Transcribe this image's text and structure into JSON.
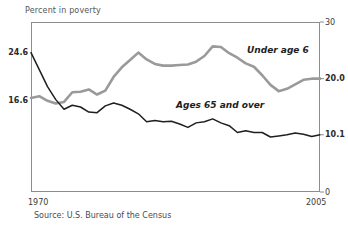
{
  "chart_data": {
    "type": "line",
    "title": "Percent in poverty",
    "xlabel": "",
    "ylabel": "Percent in poverty",
    "source": "Source:  U.S. Bureau of the Census",
    "grid": false,
    "legend_position": "inline-annotation",
    "xlim": [
      1970,
      2005
    ],
    "ylim": [
      0,
      30
    ],
    "x_tick_labels": [
      "1970",
      "2005"
    ],
    "y_tick_labels_right": [
      "30",
      "20.0",
      "10.1",
      "0"
    ],
    "y_tick_values_right": [
      30,
      20.0,
      10.1,
      0
    ],
    "y_tick_labels_left": [
      "24.6",
      "16.6"
    ],
    "y_tick_values_left": [
      24.6,
      16.6
    ],
    "x": [
      1970,
      1971,
      1972,
      1973,
      1974,
      1975,
      1976,
      1977,
      1978,
      1979,
      1980,
      1981,
      1982,
      1983,
      1984,
      1985,
      1986,
      1987,
      1988,
      1989,
      1990,
      1991,
      1992,
      1993,
      1994,
      1995,
      1996,
      1997,
      1998,
      1999,
      2000,
      2001,
      2002,
      2003,
      2004,
      2005
    ],
    "series": [
      {
        "name": "Under age 6",
        "color": "#9a9a9a",
        "annotation": "Under age 6",
        "start_value": 16.6,
        "end_value": 20.0,
        "values": [
          16.6,
          16.9,
          16.1,
          15.6,
          15.9,
          17.6,
          17.7,
          18.1,
          17.2,
          17.9,
          20.3,
          22.0,
          23.3,
          24.6,
          23.4,
          22.6,
          22.3,
          22.3,
          22.4,
          22.5,
          23.0,
          24.0,
          25.7,
          25.6,
          24.5,
          23.7,
          22.7,
          22.1,
          20.6,
          18.9,
          17.8,
          18.2,
          19.0,
          19.8,
          20.0,
          20.0
        ]
      },
      {
        "name": "Ages 65 and over",
        "color": "#1f1f1f",
        "annotation": "Ages 65 and over",
        "start_value": 24.6,
        "end_value": 10.1,
        "values": [
          24.6,
          21.6,
          18.6,
          16.3,
          14.6,
          15.3,
          15.0,
          14.1,
          14.0,
          15.2,
          15.7,
          15.3,
          14.6,
          13.8,
          12.4,
          12.6,
          12.4,
          12.5,
          12.0,
          11.4,
          12.2,
          12.4,
          12.9,
          12.2,
          11.7,
          10.5,
          10.8,
          10.5,
          10.5,
          9.7,
          9.9,
          10.1,
          10.4,
          10.2,
          9.8,
          10.1
        ]
      }
    ]
  },
  "labels": {
    "axis_title": "Percent in poverty",
    "left_top": "24.6",
    "left_bottom": "16.6",
    "right_30": "30",
    "right_20": "20.0",
    "right_101": "10.1",
    "right_0": "0",
    "x_start": "1970",
    "x_end": "2005",
    "series_gray": "Under age 6",
    "series_black": "Ages 65 and over",
    "source": "Source:  U.S. Bureau of the Census"
  }
}
